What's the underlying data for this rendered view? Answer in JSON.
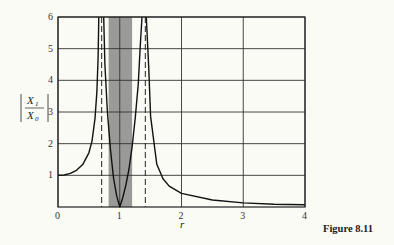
{
  "chart_data": {
    "type": "line",
    "title": "",
    "caption": "Figure 8.11",
    "xlabel": "r",
    "ylabel": "|X1 / X0|",
    "ylabel_parts": {
      "num": "X",
      "num_sub": "1",
      "den": "X",
      "den_sub": "0"
    },
    "xlim": [
      0,
      4
    ],
    "ylim": [
      0,
      6
    ],
    "x_ticks": [
      "0",
      "1",
      "2",
      "3",
      "4"
    ],
    "y_ticks": [
      "1",
      "2",
      "3",
      "4",
      "5",
      "6"
    ],
    "grid": true,
    "asymptotes_dashed": [
      0.707,
      1.414
    ],
    "shaded_band": [
      0.82,
      1.2
    ],
    "series": [
      {
        "name": "left branch",
        "x": [
          0,
          0.1,
          0.2,
          0.3,
          0.4,
          0.5,
          0.55,
          0.6,
          0.63,
          0.65,
          0.66
        ],
        "y": [
          1.0,
          1.01,
          1.06,
          1.16,
          1.34,
          1.71,
          2.08,
          2.79,
          3.65,
          4.72,
          6.0
        ]
      },
      {
        "name": "middle branch",
        "x": [
          0.74,
          0.76,
          0.8,
          0.85,
          0.9,
          0.95,
          1.0,
          1.05,
          1.1,
          1.15,
          1.2,
          1.25,
          1.3,
          1.33,
          1.36
        ],
        "y": [
          6.0,
          4.5,
          3.0,
          1.8,
          0.9,
          0.35,
          0.0,
          0.3,
          0.7,
          1.2,
          1.9,
          2.8,
          3.9,
          5.0,
          6.0
        ]
      },
      {
        "name": "right branch",
        "x": [
          1.43,
          1.47,
          1.5,
          1.6,
          1.7,
          1.8,
          2.0,
          2.5,
          3.0,
          3.5,
          4.0
        ],
        "y": [
          6.0,
          4.35,
          2.86,
          1.35,
          0.89,
          0.66,
          0.43,
          0.22,
          0.13,
          0.09,
          0.07
        ]
      }
    ]
  }
}
